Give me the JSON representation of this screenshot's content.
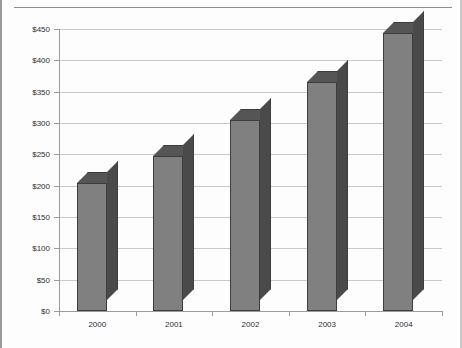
{
  "chart_data": {
    "type": "bar",
    "title": "",
    "title_visible": false,
    "xlabel": "",
    "ylabel": "",
    "categories": [
      "2000",
      "2001",
      "2002",
      "2003",
      "2004"
    ],
    "values": [
      205,
      248,
      305,
      365,
      443
    ],
    "ylim": [
      0,
      450
    ],
    "ytick_values": [
      0,
      50,
      100,
      150,
      200,
      250,
      300,
      350,
      400,
      450
    ],
    "ytick_labels": [
      "$0",
      "$50",
      "$100",
      "$150",
      "$200",
      "$250",
      "$300",
      "$350",
      "$400",
      "$450"
    ],
    "grid": true,
    "legend": false,
    "series": [
      {
        "name": "",
        "values": [
          205,
          248,
          305,
          365,
          443
        ]
      }
    ],
    "style": {
      "bar_front_color": "#808080",
      "bar_top_color": "#555555",
      "bar_side_color": "#4a4a4a",
      "bar_outline_color": "#3d3d3d",
      "gridline_color": "#c9c9c9",
      "axis_color": "#9b9b9b",
      "plot_background": "#fdfdfd",
      "text_color": "#2f2f2f",
      "three_d": true
    }
  }
}
